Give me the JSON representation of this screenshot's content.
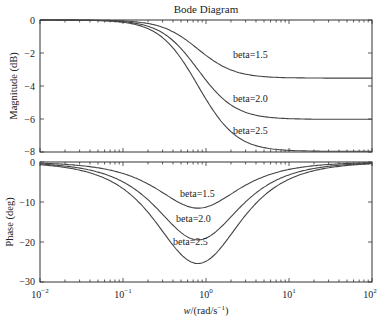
{
  "chart_data": [
    {
      "type": "line",
      "title": "Bode Diagram",
      "panel": "magnitude",
      "xlabel": "",
      "ylabel": "Magnitude (dB)",
      "xscale": "log",
      "xlim": [
        0.01,
        100
      ],
      "ylim": [
        -8,
        0
      ],
      "yticks": [
        0,
        -2,
        -4,
        -6,
        -8
      ],
      "grid": false,
      "series": [
        {
          "name": "beta=1.5",
          "beta": 1.5,
          "high_freq_dB": -3.5
        },
        {
          "name": "beta=2.0",
          "beta": 2.0,
          "high_freq_dB": -6.0
        },
        {
          "name": "beta=2.5",
          "beta": 2.5,
          "high_freq_dB": -8.0
        }
      ],
      "annotations": [
        {
          "text": "beta=1.5",
          "x": 2.2,
          "y": -2.3
        },
        {
          "text": "beta=2.0",
          "x": 2.2,
          "y": -4.8
        },
        {
          "text": "beta=2.5",
          "x": 2.2,
          "y": -6.8
        }
      ]
    },
    {
      "type": "line",
      "panel": "phase",
      "xlabel": "w/(rad/s^-1)",
      "ylabel": "Phase (deg)",
      "xscale": "log",
      "xlim": [
        0.01,
        100
      ],
      "ylim": [
        -30,
        0
      ],
      "yticks": [
        0,
        -10,
        -20,
        -30
      ],
      "xticks": [
        "10^-2",
        "10^-1",
        "10^0",
        "10^1",
        "10^2"
      ],
      "grid": false,
      "series": [
        {
          "name": "beta=1.5",
          "beta": 1.5,
          "min_phase_deg": -11.5,
          "min_at_w": 0.8
        },
        {
          "name": "beta=2.0",
          "beta": 2.0,
          "min_phase_deg": -19.5,
          "min_at_w": 0.8
        },
        {
          "name": "beta=2.5",
          "beta": 2.5,
          "min_phase_deg": -25.4,
          "min_at_w": 0.8
        }
      ],
      "annotations": [
        {
          "text": "beta=1.5",
          "x": 0.55,
          "y": -8.5
        },
        {
          "text": "beta=2.0",
          "x": 0.5,
          "y": -14.5
        },
        {
          "text": "beta=2.5",
          "x": 0.45,
          "y": -20.5
        }
      ]
    }
  ],
  "labels": {
    "title": "Bode Diagram",
    "mag_ylabel": "Magnitude (dB)",
    "phase_ylabel": "Phase (deg)",
    "xlabel_w": "w",
    "xlabel_rest": "/(rad/s",
    "xlabel_sup": "−1",
    "xlabel_close": ")",
    "mag_yticks": [
      "0",
      "−2",
      "−4",
      "−6",
      "−8"
    ],
    "phase_yticks": [
      "0",
      "−10",
      "−20",
      "−30"
    ],
    "xticks": [
      {
        "base": "10",
        "exp": "−2"
      },
      {
        "base": "10",
        "exp": "−1"
      },
      {
        "base": "10",
        "exp": "0"
      },
      {
        "base": "10",
        "exp": "1"
      },
      {
        "base": "10",
        "exp": "2"
      }
    ],
    "mag_labels": [
      "beta=1.5",
      "beta=2.0",
      "beta=2.5"
    ],
    "phase_labels": [
      "beta=1.5",
      "beta=2.0",
      "beta=2.5"
    ]
  },
  "colors": {
    "curve": "#444444",
    "axis": "#333333",
    "background": "#ffffff"
  }
}
